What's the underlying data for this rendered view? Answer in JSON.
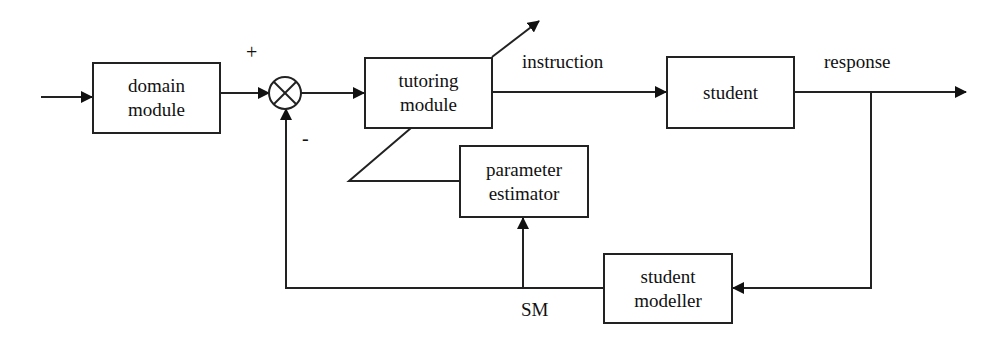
{
  "diagram": {
    "type": "feedback control block diagram",
    "blocks": {
      "domain_module": {
        "line1": "domain",
        "line2": "module"
      },
      "tutoring_module": {
        "line1": "tutoring",
        "line2": "module"
      },
      "student": {
        "line1": "student"
      },
      "parameter_estimator": {
        "line1": "parameter",
        "line2": "estimator"
      },
      "student_modeller": {
        "line1": "student",
        "line2": "modeller"
      }
    },
    "summing_junction": {
      "symbol": "⊗",
      "plus_sign": "+",
      "minus_sign": "-"
    },
    "signals": {
      "instruction": "instruction",
      "response": "response",
      "sm": "SM"
    },
    "colors": {
      "stroke": "#222222",
      "background": "#ffffff",
      "text": "#111111"
    }
  }
}
